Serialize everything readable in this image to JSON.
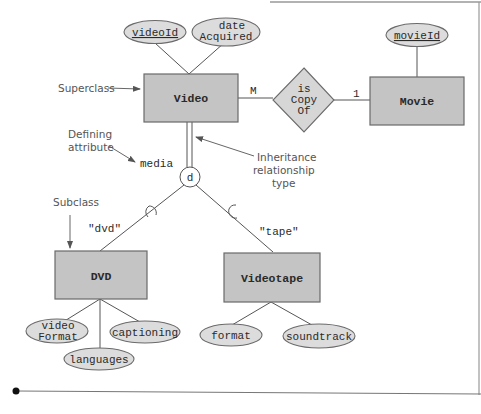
{
  "diagram": {
    "type": "EER diagram (specialization / inheritance)",
    "entities": [
      {
        "id": "video",
        "label": "Video",
        "role": "superclass"
      },
      {
        "id": "movie",
        "label": "Movie"
      },
      {
        "id": "dvd",
        "label": "DVD",
        "role": "subclass"
      },
      {
        "id": "videotape",
        "label": "Videotape",
        "role": "subclass"
      }
    ],
    "relationship": {
      "label_line1": "is",
      "label_line2": "Copy",
      "label_line3": "Of",
      "card_video": "M",
      "card_movie": "1"
    },
    "attributes": {
      "videoId": "videoId",
      "dateAcquired_line1": "date",
      "dateAcquired_line2": "Acquired",
      "movieId": "movieId",
      "videoFormat_line1": "video",
      "videoFormat_line2": "Format",
      "languages": "languages",
      "captioning": "captioning",
      "format": "format",
      "soundtrack": "soundtrack"
    },
    "specialization": {
      "symbol": "d",
      "defining_attribute": "media",
      "dvd_value": "\"dvd\"",
      "tape_value": "\"tape\""
    },
    "annotations": {
      "superclass": "Superclass",
      "defining_line1": "Defining",
      "defining_line2": "attribute",
      "inheritance_line1": "Inheritance",
      "inheritance_line2": "relationship",
      "inheritance_line3": "type",
      "subclass": "Subclass"
    }
  }
}
